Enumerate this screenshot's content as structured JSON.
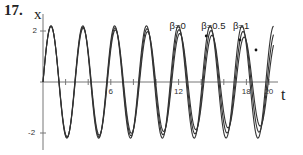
{
  "figure": {
    "problem_number": "17.",
    "y_axis_label": "x",
    "x_axis_label": "t"
  },
  "chart_data": {
    "type": "line",
    "title": "",
    "xlabel": "t",
    "ylabel": "x",
    "xlim": [
      0,
      21
    ],
    "ylim": [
      -2.4,
      2.4
    ],
    "x_ticks": [
      2,
      4,
      6,
      8,
      10,
      12,
      14,
      16,
      18,
      20
    ],
    "x_tick_labels": [
      {
        "value": 6,
        "label": "6"
      },
      {
        "value": 12,
        "label": "12"
      },
      {
        "value": 18,
        "label": "18"
      },
      {
        "value": 20,
        "label": "20"
      }
    ],
    "y_ticks": [
      {
        "value": 2,
        "label": "2"
      },
      {
        "value": -2,
        "label": "-2"
      }
    ],
    "grid": false,
    "legend_position": "inline annotations above peaks",
    "annotations": [
      {
        "text": "β=0",
        "t": 12.0,
        "x": 2.2
      },
      {
        "text": "β=0.5",
        "t": 14.8,
        "x": 2.2
      },
      {
        "text": "β=1",
        "t": 17.6,
        "x": 2.2
      }
    ],
    "series": [
      {
        "name": "β=0",
        "omega": 2.23,
        "amplitude_start": 2.2,
        "amplitude_end": 2.2,
        "t_end": 20.4
      },
      {
        "name": "β=0.5",
        "omega": 2.23,
        "amplitude_start": 2.2,
        "amplitude_end": 1.95,
        "t_end": 20.4
      },
      {
        "name": "β=1",
        "omega": 2.23,
        "amplitude_start": 2.2,
        "amplitude_end": 1.7,
        "t_end": 20.4
      }
    ],
    "approx_peaks_t": [
      0.7,
      3.5,
      6.3,
      9.2,
      12.0,
      14.8,
      17.6
    ],
    "approx_troughs_t": [
      2.1,
      4.9,
      7.8,
      10.6,
      13.4,
      16.2,
      19.0
    ]
  },
  "style": {
    "line_color": "#333333",
    "axis_color": "#777777"
  }
}
